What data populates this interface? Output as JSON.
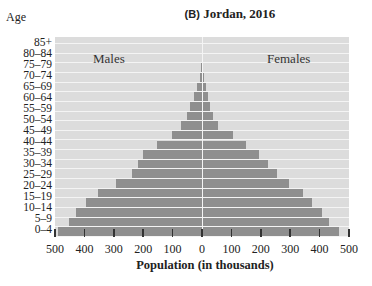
{
  "chart_data": {
    "type": "bar",
    "orientation": "horizontal",
    "subtype": "population-pyramid",
    "title": "(B) Jordan, 2016",
    "panel_letter": "B",
    "title_text": "Jordan, 2016",
    "xlabel": "Population (in thousands)",
    "ylabel": "Age",
    "categories": [
      "85+",
      "80–84",
      "75–79",
      "70–74",
      "65–69",
      "60–64",
      "55–59",
      "50–54",
      "45–49",
      "40–44",
      "35–39",
      "30–34",
      "25–29",
      "20–24",
      "15–19",
      "10–14",
      "5–9",
      "0–4"
    ],
    "series": [
      {
        "name": "Males",
        "values": [
          3,
          8,
          16,
          26,
          41,
          52,
          72,
          103,
          152,
          202,
          218,
          238,
          293,
          354,
          395,
          429,
          452,
          490
        ]
      },
      {
        "name": "Females",
        "values": [
          3,
          6,
          13,
          19,
          27,
          38,
          53,
          104,
          150,
          194,
          225,
          255,
          296,
          344,
          374,
          408,
          432,
          465
        ]
      }
    ],
    "xlim": [
      -500,
      500
    ],
    "xticks": [
      "500",
      "400",
      "300",
      "200",
      "100",
      "0",
      "100",
      "200",
      "300",
      "400",
      "500"
    ],
    "grid": false,
    "annotations": [
      "Males",
      "Females"
    ],
    "colors": {
      "bar": "#8f8f8f",
      "background": "#dcdcdc",
      "separator": "#f4f4f4"
    }
  },
  "labels": {
    "panel": "(B)",
    "title": "Jordan, 2016",
    "age": "Age",
    "males": "Males",
    "females": "Females",
    "xlabel": "Population (in thousands)"
  }
}
